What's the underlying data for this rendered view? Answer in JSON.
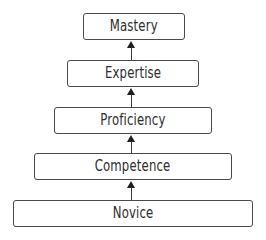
{
  "diagram": {
    "type": "hierarchy-ladder",
    "direction": "bottom-to-top",
    "levels": [
      {
        "label": "Mastery",
        "x": 83,
        "y": 13,
        "w": 102,
        "h": 27
      },
      {
        "label": "Expertise",
        "x": 67,
        "y": 60,
        "w": 132,
        "h": 27
      },
      {
        "label": "Proficiency",
        "x": 54,
        "y": 107,
        "w": 158,
        "h": 27
      },
      {
        "label": "Competence",
        "x": 34,
        "y": 153,
        "w": 198,
        "h": 27
      },
      {
        "label": "Novice",
        "x": 13,
        "y": 200,
        "w": 240,
        "h": 27
      }
    ],
    "arrows": [
      {
        "from": "Novice",
        "to": "Competence",
        "x": 131,
        "top": 181,
        "bottom": 200
      },
      {
        "from": "Competence",
        "to": "Proficiency",
        "x": 131,
        "top": 135,
        "bottom": 153
      },
      {
        "from": "Proficiency",
        "to": "Expertise",
        "x": 131,
        "top": 88,
        "bottom": 107
      },
      {
        "from": "Expertise",
        "to": "Mastery",
        "x": 131,
        "top": 41,
        "bottom": 60
      }
    ],
    "colors": {
      "border": "#4a4a4a",
      "text": "#2e2e2e",
      "arrow": "#1e1e1e",
      "background": "#ffffff"
    }
  }
}
